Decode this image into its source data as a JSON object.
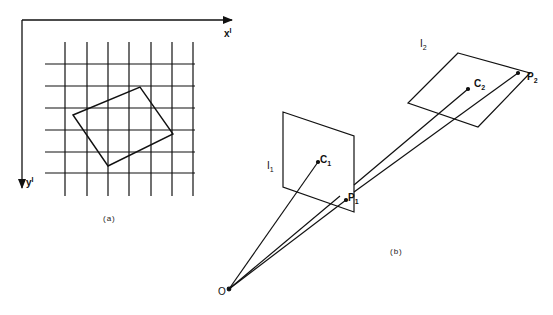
{
  "figure_a": {
    "caption": "(a)",
    "x_axis_label": "x",
    "x_axis_sup": "I",
    "y_axis_label": "y",
    "y_axis_sup": "I",
    "grid": {
      "vertical_lines_x": [
        65,
        87,
        108,
        129,
        151,
        172,
        193
      ],
      "horizontal_lines_y": [
        64,
        86,
        108,
        130,
        152,
        173
      ]
    },
    "rotated_square": [
      [
        73,
        115
      ],
      [
        140,
        87
      ],
      [
        173,
        134
      ],
      [
        108,
        166
      ]
    ]
  },
  "figure_b": {
    "caption": "(b)",
    "origin_label": "O",
    "plane1": {
      "label": "I",
      "sub": "1"
    },
    "plane2": {
      "label": "I",
      "sub": "2"
    },
    "points": {
      "c1": {
        "label": "C",
        "sub": "1"
      },
      "p1": {
        "label": "P",
        "sub": "1"
      },
      "c2": {
        "label": "C",
        "sub": "2"
      },
      "p2": {
        "label": "P",
        "sub": "2"
      }
    }
  },
  "colors": {
    "ink": "#111111",
    "background": "#ffffff"
  }
}
